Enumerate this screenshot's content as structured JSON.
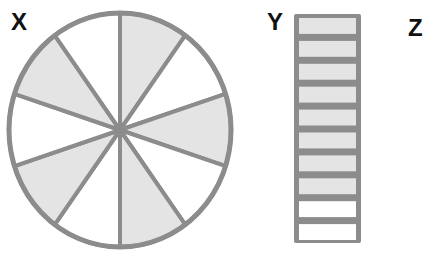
{
  "labels": {
    "x": "X",
    "y": "Y",
    "z": "Z"
  },
  "colors": {
    "outline": "#8c8c8c",
    "shaded_fill": "#e4e4e4",
    "unshaded_fill": "#ffffff",
    "label_text": "#111111"
  },
  "figure_x": {
    "type": "circle-divided",
    "total_parts": 10,
    "shaded_parts": 5,
    "shaded_pattern": [
      true,
      false,
      true,
      false,
      true,
      false,
      true,
      false,
      true,
      false
    ]
  },
  "figure_y": {
    "type": "vertical-bar-divided",
    "total_parts": 10,
    "shaded_parts": 8,
    "shaded_pattern": [
      true,
      true,
      true,
      true,
      true,
      true,
      true,
      true,
      false,
      false
    ]
  },
  "figure_z": {
    "type": "empty"
  }
}
